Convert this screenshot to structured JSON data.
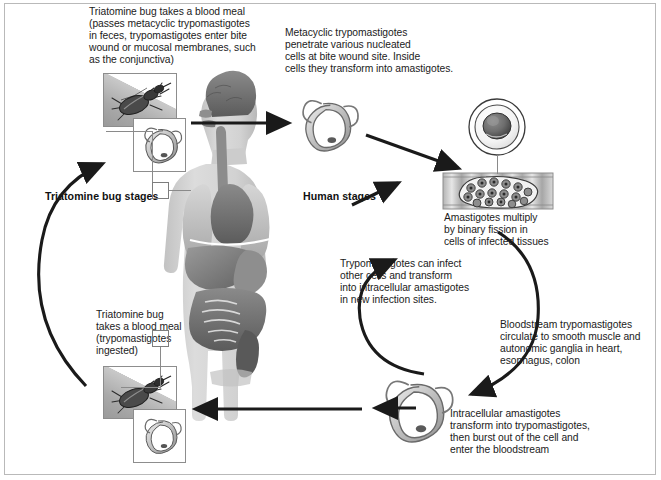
{
  "diagram": {
    "section_labels": {
      "vector": "Triatomine bug stages",
      "host": "Human stages"
    },
    "captions": {
      "bug_blood_meal_infective": "Triatomine bug takes a blood meal\n(passes metacyclic trypomastigotes\nin feces, trypomastigotes enter bite\nwound or mucosal membranes, such\nas the conjunctiva)",
      "metacyclic_penetrate": "Metacyclic trypomastigotes\npenetrate various nucleated\ncells at bite wound site. Inside\ncells they transform into amastigotes.",
      "amastigotes_multiply": "Amastigotes multiply\nby binary fission in\ncells of infected tissues",
      "trypomastigotes_reinfect": "Trypomastigotes can infect\nother cells and transform\ninto intracellular amastigotes\nin new infection sites.",
      "bloodstream_circulate": "Bloodstream trypomastigotes\ncirculate to smooth muscle and\nautonomic ganglia in heart,\nesophagus, colon",
      "intracellular_transform": "Intracellular amastigotes\ntransform into trypomastigotes,\nthen burst out of the cell and\nenter the bloodstream",
      "bug_blood_meal_ingest": "Triatomine bug\ntakes a blood meal\n(trypomastigotes\ningested)"
    },
    "illustrations": {
      "bug_top": "triatomine-bug-photo",
      "bug_top_inset": "trypomastigote-inset",
      "bug_bottom": "triatomine-bug-photo",
      "bug_bottom_inset": "trypomastigote-inset",
      "human_body": "human-torso-organs",
      "trypomastigote_top": "metacyclic-trypomastigote",
      "nucleated_cell": "nucleated-cell-with-nucleus",
      "muscle_tissue": "muscle-tissue-pseudocyst-amastigotes",
      "trypomastigote_bottom": "bloodstream-trypomastigote"
    },
    "colors": {
      "arrow": "#1a1a1a",
      "frame": "#b9b9b9",
      "body_fill": "#cfcfcf",
      "organ_dark": "#6f6f6f",
      "text": "#1b1b1b"
    }
  }
}
